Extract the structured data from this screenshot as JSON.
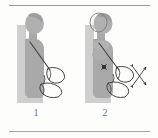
{
  "figure": {
    "panels": [
      {
        "id": "panel-1",
        "caption": "1",
        "description": "Seated person in profile against a wall with scapula outlines, resting position",
        "head_state": "neutral",
        "has_motion_arrows": false,
        "has_marker_dot": false
      },
      {
        "id": "panel-2",
        "caption": "2",
        "description": "Seated person in profile with scapula outlines, head retracted and four-way motion arrows indicating scapular glide",
        "head_state": "retracted",
        "has_motion_arrows": true,
        "has_marker_dot": true
      }
    ],
    "arrows": {
      "name": "four-way-motion-arrows",
      "count": 4,
      "style": "double-headed-cross",
      "directions": [
        "up-right",
        "down-right",
        "up-left",
        "down-left"
      ]
    }
  },
  "colors": {
    "page_background": "#fdfdfc",
    "rule": "#9a9a9a",
    "body_fill": "#a9a9a9",
    "wall_fill": "#cfcfcf",
    "head_fill": "#b0b0b0",
    "outline": "#3c3c3c",
    "arrow": "#2f2f2f",
    "caption_text": "#6e6e6e",
    "marker_dot": "#2b2b2b"
  }
}
